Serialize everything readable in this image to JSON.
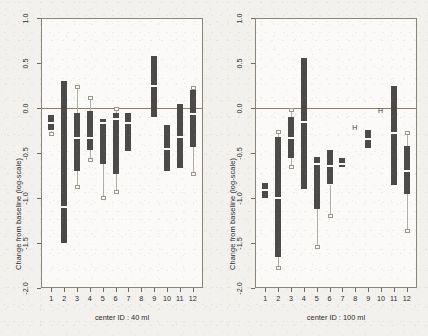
{
  "figure": {
    "background_color": "#f2f1ee",
    "plot_background_color": "#fbfaf8",
    "frame_color": "#8a8579",
    "bar_color": "#4b4a48",
    "whisker_color": "#b3aea3",
    "zero_line_color": "#8e7f63",
    "median_color": "#fbfaf8"
  },
  "chart_data": [
    {
      "type": "bar",
      "title": "",
      "panel_id": "left",
      "xlabel": "center ID : 40 ml",
      "ylabel": "Change from baseline (log-scale)",
      "ylim": [
        -2.0,
        1.0
      ],
      "yticks": [
        1.0,
        0.5,
        0.0,
        -0.5,
        -1.0,
        -1.5,
        -2.0
      ],
      "ytick_labels": [
        "1.0",
        "0.5",
        "0.0",
        "-0.5",
        "-1.0",
        "-1.5",
        "-2.0"
      ],
      "categories": [
        "1",
        "2",
        "3",
        "4",
        "5",
        "6",
        "7",
        "8",
        "9",
        "10",
        "11",
        "12"
      ],
      "grid": false,
      "legend": "none",
      "reference_line": 0.0,
      "series": [
        {
          "name": "inner interval (box) low",
          "values": [
            -0.25,
            -1.5,
            -0.7,
            -0.47,
            -0.62,
            -0.73,
            -0.48,
            -0.33,
            -0.1,
            -0.7,
            -0.67,
            -0.43
          ]
        },
        {
          "name": "inner interval (box) high",
          "values": [
            -0.08,
            0.3,
            -0.06,
            -0.03,
            -0.12,
            -0.06,
            -0.06,
            -0.31,
            0.58,
            -0.19,
            0.05,
            0.2
          ]
        },
        {
          "name": "median",
          "values": [
            -0.17,
            -1.1,
            -0.33,
            -0.33,
            -0.17,
            -0.12,
            -0.17,
            -0.32,
            0.24,
            -0.46,
            -0.32,
            -0.07
          ]
        },
        {
          "name": "outer interval low",
          "values": [
            -0.29,
            null,
            -0.88,
            -0.58,
            -1.0,
            -0.93,
            null,
            null,
            null,
            null,
            null,
            -0.73
          ]
        },
        {
          "name": "outer interval high",
          "values": [
            null,
            null,
            0.23,
            0.11,
            null,
            -0.01,
            null,
            null,
            null,
            null,
            null,
            0.22
          ]
        }
      ]
    },
    {
      "type": "bar",
      "title": "",
      "panel_id": "right",
      "xlabel": "center ID : 100 ml",
      "ylabel": "Change from baseline (log-scale)",
      "ylim": [
        -2.0,
        1.0
      ],
      "yticks": [
        1.0,
        0.5,
        0.0,
        -0.5,
        -1.0,
        -1.5,
        -2.0
      ],
      "ytick_labels": [
        "1.0",
        "0.5",
        "0.0",
        "-0.5",
        "-1.0",
        "-1.5",
        "-2.0"
      ],
      "categories": [
        "1",
        "2",
        "3",
        "4",
        "5",
        "6",
        "7",
        "8",
        "9",
        "10",
        "11",
        "12"
      ],
      "grid": false,
      "legend": "none",
      "reference_line": 0.0,
      "series": [
        {
          "name": "inner interval (box) low",
          "values": [
            -1.0,
            -1.66,
            -0.56,
            -0.9,
            -1.12,
            -0.85,
            -0.66,
            -0.22,
            -0.45,
            -0.03,
            -0.86,
            -0.96
          ]
        },
        {
          "name": "inner interval (box) high",
          "values": [
            -0.83,
            -0.32,
            -0.1,
            0.56,
            -0.54,
            -0.47,
            -0.56,
            -0.22,
            -0.24,
            -0.03,
            0.25,
            -0.42
          ]
        },
        {
          "name": "median",
          "values": [
            -0.91,
            -1.0,
            -0.33,
            -0.15,
            -0.62,
            -0.64,
            -0.62,
            -0.22,
            -0.34,
            -0.03,
            -0.28,
            -0.7
          ]
        },
        {
          "name": "outer interval low",
          "values": [
            null,
            -1.78,
            -0.66,
            null,
            -1.54,
            -1.2,
            null,
            null,
            null,
            null,
            null,
            -1.37
          ]
        },
        {
          "name": "outer interval high",
          "values": [
            null,
            -0.27,
            -0.02,
            null,
            null,
            null,
            null,
            null,
            null,
            null,
            null,
            -0.28
          ]
        }
      ]
    }
  ]
}
